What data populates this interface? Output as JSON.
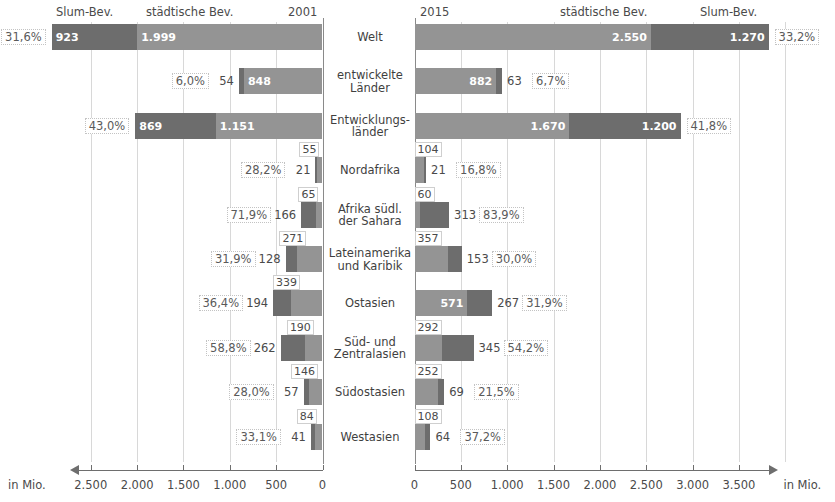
{
  "header": {
    "left_slum_label": "Slum-Bev.",
    "left_urban_label": "städtische Bev.",
    "left_year": "2001",
    "right_year": "2015",
    "right_urban_label": "städtische Bev.",
    "right_slum_label": "Slum-Bev."
  },
  "axis": {
    "unit_left": "in Mio.",
    "unit_right": "in Mio.",
    "left_ticks": [
      "2.500",
      "2.000",
      "1.500",
      "1.000",
      "500",
      "0"
    ],
    "right_ticks": [
      "0",
      "500",
      "1.000",
      "1.500",
      "2.000",
      "2.500",
      "3.000",
      "3.500",
      ""
    ]
  },
  "colors": {
    "slum": "#6d6d6d",
    "urban": "#949494",
    "grid": "#d8d8d8",
    "text": "#3a3a3a"
  },
  "chart_data": {
    "type": "bar",
    "xlabel": "in Mio.",
    "ylabel": "",
    "orientation": "horizontal-diverging",
    "unit": "Mio.",
    "xlim_left": [
      0,
      2500
    ],
    "xlim_right": [
      0,
      3500
    ],
    "grid": true,
    "legend": [
      "Slum-Bev.",
      "städtische Bev."
    ],
    "legend_position": "top",
    "categories": [
      "Welt",
      "entwickelte Länder",
      "Entwicklungsländer",
      "Nordafrika",
      "Afrika südl. der Sahara",
      "Lateinamerika und Karibik",
      "Ostasien",
      "Süd- und Zentralasien",
      "Südostasien",
      "Westasien"
    ],
    "series": [
      {
        "name": "Slum-Bev. 2001",
        "values": [
          923,
          54,
          869,
          21,
          166,
          128,
          194,
          262,
          57,
          41
        ]
      },
      {
        "name": "städtische Bev. 2001",
        "values": [
          1999,
          848,
          1151,
          55,
          65,
          271,
          339,
          190,
          146,
          84
        ]
      },
      {
        "name": "Anteil 2001",
        "values": [
          "31,6%",
          "6,0%",
          "43,0%",
          "28,2%",
          "71,9%",
          "31,9%",
          "36,4%",
          "58,8%",
          "28,0%",
          "33,1%"
        ]
      },
      {
        "name": "städtische Bev. 2015",
        "values": [
          2550,
          882,
          1670,
          104,
          60,
          357,
          571,
          292,
          252,
          108
        ]
      },
      {
        "name": "Slum-Bev. 2015",
        "values": [
          1270,
          63,
          1200,
          21,
          313,
          153,
          267,
          345,
          69,
          64
        ]
      },
      {
        "name": "Anteil 2015",
        "values": [
          "33,2%",
          "6,7%",
          "41,8%",
          "16,8%",
          "83,9%",
          "30,0%",
          "31,9%",
          "54,2%",
          "21,5%",
          "37,2%"
        ]
      }
    ]
  },
  "rows": [
    {
      "label": "Welt",
      "l_pct": "31,6%",
      "l_slum": "923",
      "l_urban": "1.999",
      "r_urban": "2.550",
      "r_slum": "1.270",
      "r_pct": "33,2%"
    },
    {
      "label_line1": "entwickelte",
      "label_line2": "Länder",
      "label": "entwickelte Länder",
      "l_pct": "6,0%",
      "l_slum": "54",
      "l_urban": "848",
      "r_urban": "882",
      "r_slum": "63",
      "r_pct": "6,7%"
    },
    {
      "label_line1": "Entwicklungs-",
      "label_line2": "länder",
      "label": "Entwicklungsländer",
      "l_pct": "43,0%",
      "l_slum": "869",
      "l_urban": "1.151",
      "r_urban": "1.670",
      "r_slum": "1.200",
      "r_pct": "41,8%"
    },
    {
      "label": "Nordafrika",
      "l_pct": "28,2%",
      "l_slum": "21",
      "l_urban": "55",
      "r_urban": "104",
      "r_slum": "21",
      "r_pct": "16,8%"
    },
    {
      "label_line1": "Afrika südl.",
      "label_line2": "der Sahara",
      "label": "Afrika südl. der Sahara",
      "l_pct": "71,9%",
      "l_slum": "166",
      "l_urban": "65",
      "r_urban": "60",
      "r_slum": "313",
      "r_pct": "83,9%"
    },
    {
      "label_line1": "Lateinamerika",
      "label_line2": "und Karibik",
      "label": "Lateinamerika und Karibik",
      "l_pct": "31,9%",
      "l_slum": "128",
      "l_urban": "271",
      "r_urban": "357",
      "r_slum": "153",
      "r_pct": "30,0%"
    },
    {
      "label": "Ostasien",
      "l_pct": "36,4%",
      "l_slum": "194",
      "l_urban": "339",
      "r_urban": "571",
      "r_slum": "267",
      "r_pct": "31,9%"
    },
    {
      "label_line1": "Süd- und",
      "label_line2": "Zentralasien",
      "label": "Süd- und Zentralasien",
      "l_pct": "58,8%",
      "l_slum": "262",
      "l_urban": "190",
      "r_urban": "292",
      "r_slum": "345",
      "r_pct": "54,2%"
    },
    {
      "label": "Südostasien",
      "l_pct": "28,0%",
      "l_slum": "57",
      "l_urban": "146",
      "r_urban": "252",
      "r_slum": "69",
      "r_pct": "21,5%"
    },
    {
      "label": "Westasien",
      "l_pct": "33,1%",
      "l_slum": "41",
      "l_urban": "84",
      "r_urban": "108",
      "r_slum": "64",
      "r_pct": "37,2%"
    }
  ]
}
